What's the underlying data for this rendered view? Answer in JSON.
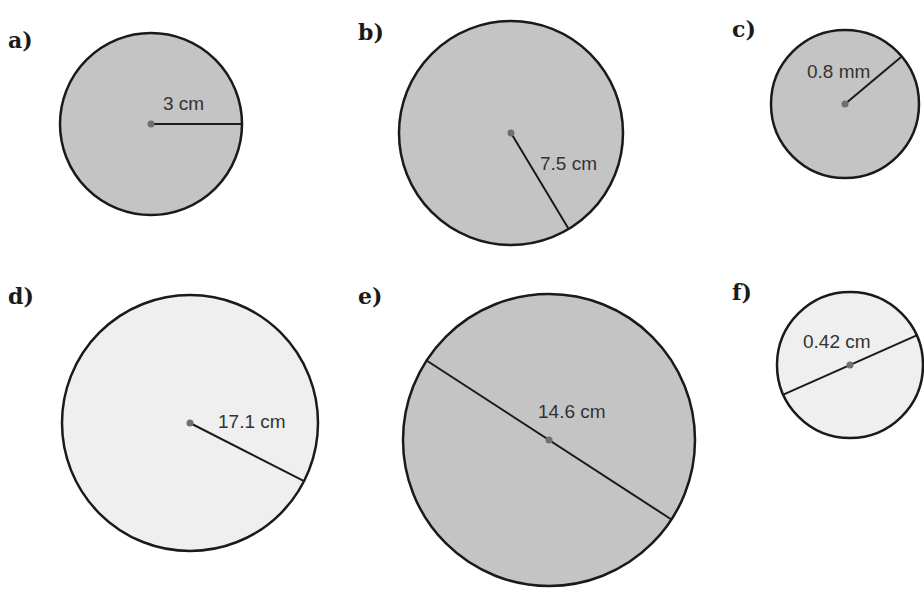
{
  "colors": {
    "fill_dark": "#c4c4c4",
    "fill_light": "#efefef",
    "stroke": "#1a1a1a",
    "center_dot": "#707070"
  },
  "circles": [
    {
      "label": "a)",
      "measure": "3 cm",
      "kind": "radius",
      "cx": 151,
      "cy": 124,
      "r": 91,
      "angle": 0,
      "shade": "dark",
      "label_x": 8,
      "label_y": 48,
      "text_x": 163,
      "text_y": 110
    },
    {
      "label": "b)",
      "measure": "7.5 cm",
      "kind": "radius",
      "cx": 511,
      "cy": 133,
      "r": 112,
      "angle": 59,
      "shade": "dark",
      "label_x": 358,
      "label_y": 40,
      "text_x": 540,
      "text_y": 170
    },
    {
      "label": "c)",
      "measure": "0.8 mm",
      "kind": "radius",
      "cx": 845,
      "cy": 104,
      "r": 74,
      "angle": -40,
      "shade": "dark",
      "label_x": 732,
      "label_y": 37,
      "text_x": 807,
      "text_y": 78
    },
    {
      "label": "d)",
      "measure": "17.1 cm",
      "kind": "radius",
      "cx": 190,
      "cy": 423,
      "r": 128,
      "angle": 27,
      "shade": "light",
      "label_x": 8,
      "label_y": 304,
      "text_x": 218,
      "text_y": 428
    },
    {
      "label": "e)",
      "measure": "14.6 cm",
      "kind": "diameter",
      "cx": 549,
      "cy": 440,
      "r": 146,
      "angle": 33,
      "shade": "dark",
      "label_x": 358,
      "label_y": 304,
      "text_x": 538,
      "text_y": 418
    },
    {
      "label": "f)",
      "measure": "0.42 cm",
      "kind": "diameter",
      "cx": 850,
      "cy": 365,
      "r": 73,
      "angle": -24,
      "shade": "light",
      "label_x": 732,
      "label_y": 300,
      "text_x": 803,
      "text_y": 348
    }
  ]
}
